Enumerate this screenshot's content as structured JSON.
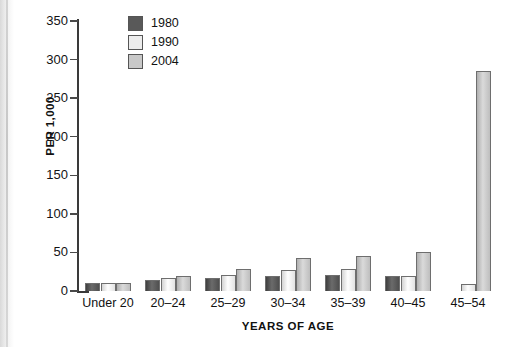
{
  "chart_data": {
    "type": "bar",
    "title": "",
    "subtitle": "",
    "xlabel": "YEARS OF AGE",
    "ylabel": "PER 1,000",
    "ylim": [
      0,
      350
    ],
    "yticks": [
      0,
      50,
      100,
      150,
      200,
      250,
      300,
      350
    ],
    "ytick_labels": [
      "0",
      "50",
      "100",
      "150",
      "200",
      "250",
      "300",
      "350"
    ],
    "grid": false,
    "legend_position": "top-left-inside",
    "categories": [
      "Under 20",
      "20–24",
      "25–29",
      "30–34",
      "35–39",
      "40–45",
      "45–54"
    ],
    "series": [
      {
        "name": "1980",
        "color": "#595959",
        "values": [
          11,
          14,
          17,
          19,
          21,
          19,
          0
        ]
      },
      {
        "name": "1990",
        "color": "#ececec",
        "values": [
          11,
          17,
          21,
          27,
          28,
          20,
          9
        ]
      },
      {
        "name": "2004",
        "color": "#c8c8c8",
        "values": [
          11,
          20,
          28,
          43,
          46,
          50,
          285
        ]
      }
    ]
  },
  "legend": {
    "entries": [
      {
        "label": "1980",
        "swatch_color": "#595959"
      },
      {
        "label": "1990",
        "swatch_color": "#ececec"
      },
      {
        "label": "2004",
        "swatch_color": "#c8c8c8"
      }
    ]
  },
  "axes": {
    "y_title": "PER 1,000",
    "x_title": "YEARS OF AGE"
  }
}
